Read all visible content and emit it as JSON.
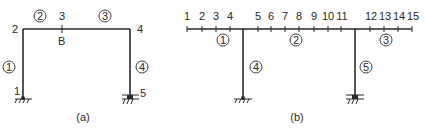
{
  "figure_a": {
    "caption": "(a)",
    "nodes": [
      {
        "id": "1",
        "x": 17,
        "y": 92
      },
      {
        "id": "2",
        "x": 15,
        "y": 33
      },
      {
        "id": "3",
        "x": 62,
        "y": 19
      },
      {
        "id": "4",
        "x": 140,
        "y": 33
      },
      {
        "id": "5",
        "x": 144,
        "y": 96
      }
    ],
    "point_label": "B",
    "members": [
      "1",
      "2",
      "3",
      "4"
    ]
  },
  "figure_b": {
    "caption": "(b)",
    "nodes": [
      "1",
      "2",
      "3",
      "4",
      "5",
      "6",
      "7",
      "8",
      "9",
      "10",
      "11",
      "12",
      "13",
      "14",
      "15"
    ],
    "members": [
      "1",
      "2",
      "3",
      "4",
      "5"
    ]
  }
}
